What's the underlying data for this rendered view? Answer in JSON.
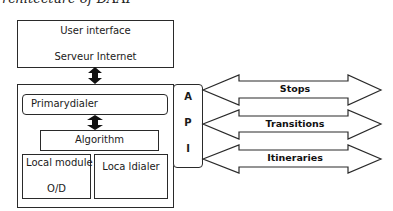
{
  "caption": "rchitecture of DAAF",
  "top_box": {
    "line1": "User interface",
    "line2": "Serveur Internet"
  },
  "main_box": {
    "primary_dialer": "Primarydialer",
    "algorithm": "Algorithm",
    "local_module": {
      "line1": "Local module",
      "line2": "O/D"
    },
    "local_dialer": "Loca ldialer"
  },
  "api": {
    "letters": [
      "A",
      "P",
      "I"
    ]
  },
  "arrows": [
    {
      "label": "Stops"
    },
    {
      "label": "Transitions"
    },
    {
      "label": "Itineraries"
    }
  ]
}
